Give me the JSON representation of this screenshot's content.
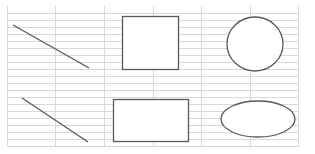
{
  "canvas": {
    "width": 315,
    "height": 154,
    "background": "#ffffff"
  },
  "grid": {
    "color": "#d9d9d9",
    "left": 7,
    "right": 298,
    "top": 6,
    "bottom": 147,
    "vertical_lines": [
      7,
      55,
      104,
      153,
      201,
      250,
      298
    ],
    "horizontal_lines": [
      13,
      20,
      27,
      34,
      41,
      48,
      55,
      62,
      69,
      76,
      83,
      90,
      97,
      104,
      111,
      118,
      125,
      132,
      139,
      146
    ]
  },
  "shapes": {
    "stroke": "#595959",
    "line_top": {
      "x1": 13,
      "y1": 25,
      "x2": 89,
      "y2": 68
    },
    "rect_top": {
      "x": 122,
      "y": 16,
      "w": 56,
      "h": 53
    },
    "circle_top": {
      "cx": 255,
      "cy": 44,
      "rx": 28,
      "ry": 27
    },
    "line_bottom": {
      "x1": 22,
      "y1": 98,
      "x2": 88,
      "y2": 142
    },
    "rect_bottom": {
      "x": 113,
      "y": 99,
      "w": 75,
      "h": 42
    },
    "ellipse_bottom": {
      "cx": 258,
      "cy": 119,
      "rx": 37,
      "ry": 18
    }
  }
}
